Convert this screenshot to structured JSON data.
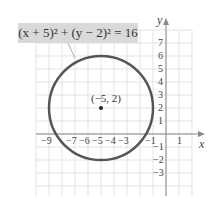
{
  "chart_data": {
    "type": "line",
    "equation_label": "(x + 5)² + (y − 2)² = 16",
    "shape": "circle",
    "center": {
      "x": -5,
      "y": 2,
      "label": "(−5, 2)"
    },
    "radius": 4,
    "xlabel": "x",
    "ylabel": "y",
    "xlim": [
      -10,
      2
    ],
    "ylim": [
      -4,
      8
    ],
    "grid": true,
    "x_tick_labels": [
      "−9",
      "−7",
      "−6",
      "−5",
      "−4",
      "−3",
      "−1",
      "1"
    ],
    "x_ticks": [
      -9,
      -7,
      -6,
      -5,
      -4,
      -3,
      -1,
      1
    ],
    "y_tick_labels": [
      "7",
      "6",
      "5",
      "4",
      "3",
      "2",
      "1",
      "−1",
      "−2",
      "−3"
    ],
    "y_ticks": [
      7,
      6,
      5,
      4,
      3,
      2,
      1,
      -1,
      -2,
      -3
    ],
    "colors": {
      "circle": "#555555",
      "grid": "#e3e3e3",
      "axis": "#888888",
      "label_box": "#d9d9d9"
    }
  }
}
